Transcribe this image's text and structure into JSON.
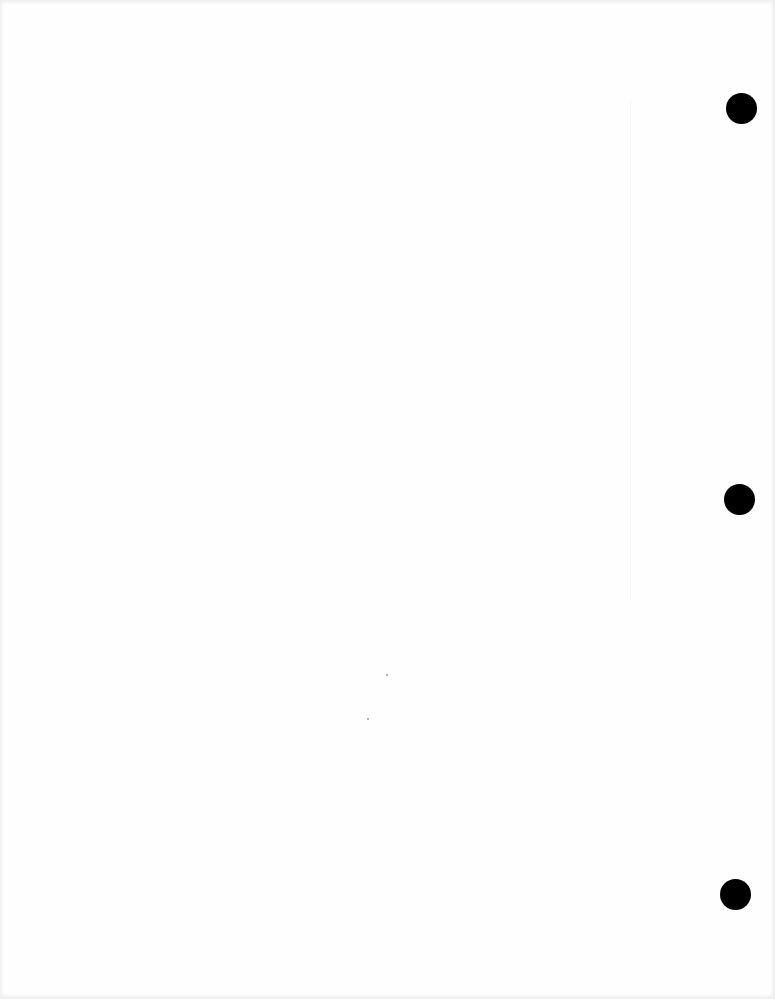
{
  "page": {
    "type": "blank-scanned-sheet",
    "background_color": "#ffffff",
    "text_content": ""
  },
  "binder_holes": [
    {
      "id": "top",
      "cx": 741,
      "cy": 108,
      "r": 15,
      "color": "#000000"
    },
    {
      "id": "middle",
      "cx": 739,
      "cy": 499,
      "r": 15,
      "color": "#000000"
    },
    {
      "id": "bottom",
      "cx": 735,
      "cy": 894,
      "r": 15,
      "color": "#000000"
    }
  ],
  "artifacts": [
    {
      "id": "speck-1",
      "x": 386,
      "y": 674
    },
    {
      "id": "speck-2",
      "x": 367,
      "y": 718
    }
  ]
}
